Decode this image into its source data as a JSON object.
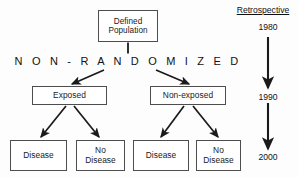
{
  "diagram": {
    "stroke_color": "#4d4d4d",
    "text_color": "#1a1a1a",
    "background": "#fdfdfd",
    "nodes": {
      "defined_population": "Defined\nPopulation",
      "defined_population_line1": "Defined",
      "defined_population_line2": "Population",
      "exposed": "Exposed",
      "non_exposed": "Non-exposed",
      "disease_left": "Disease",
      "no_disease_left_line1": "No",
      "no_disease_left_line2": "Disease",
      "disease_right": "Disease",
      "no_disease_right_line1": "No",
      "no_disease_right_line2": "Disease"
    },
    "allocation_label": "N O N - R A N D O M I Z E D"
  },
  "timeline": {
    "heading": "Retrospective",
    "years": [
      "1980",
      "1990",
      "2000"
    ],
    "year_1980": "1980",
    "year_1990": "1990",
    "year_2000": "2000",
    "direction": "downward"
  }
}
